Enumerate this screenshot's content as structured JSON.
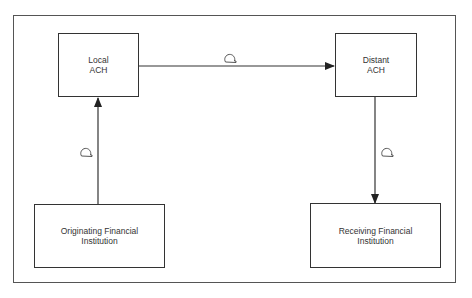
{
  "diagram": {
    "type": "flow",
    "nodes": [
      {
        "id": "local_ach",
        "line1": "Local",
        "line2": "ACH"
      },
      {
        "id": "distant_ach",
        "line1": "Distant",
        "line2": "ACH"
      },
      {
        "id": "originating_fi",
        "line1": "Originating Financial",
        "line2": "Institution"
      },
      {
        "id": "receiving_fi",
        "line1": "Receiving Financial",
        "line2": "Institution"
      }
    ],
    "edges": [
      {
        "from": "originating_fi",
        "to": "local_ach",
        "label_icon": "magnetic-tape-icon"
      },
      {
        "from": "local_ach",
        "to": "distant_ach",
        "label_icon": "magnetic-tape-icon"
      },
      {
        "from": "distant_ach",
        "to": "receiving_fi",
        "label_icon": "magnetic-tape-icon"
      }
    ],
    "colors": {
      "line": "#333333",
      "background": "#ffffff",
      "frame": "#555555"
    }
  }
}
